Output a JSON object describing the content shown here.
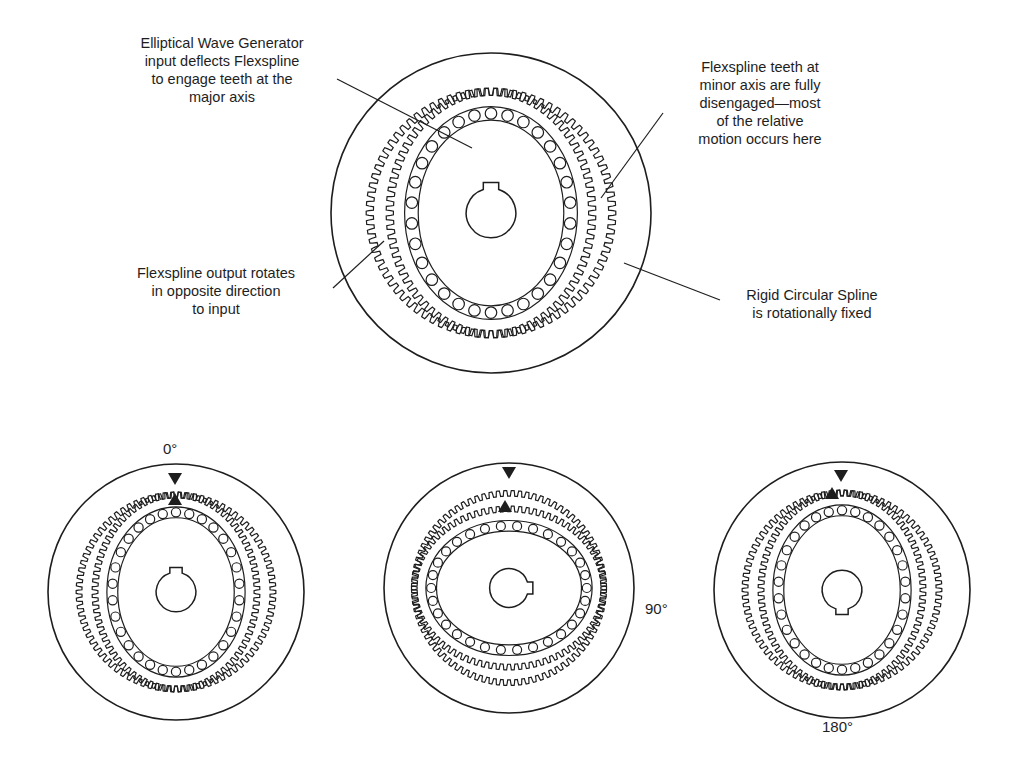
{
  "figure": {
    "main_diagram": {
      "components": [
        "Rigid Circular Spline",
        "Flexspline",
        "Elliptical Wave Generator",
        "Ball bearing ring",
        "Keyed input hub"
      ],
      "callouts": [
        {
          "id": "wave-generator",
          "lines": [
            "Elliptical Wave Generator",
            "input deflects Flexspline",
            "to engage teeth at the",
            "major axis"
          ]
        },
        {
          "id": "minor-axis",
          "lines": [
            "Flexspline teeth at",
            "minor axis are fully",
            "disengaged—most",
            "of the relative",
            "motion occurs here"
          ]
        },
        {
          "id": "flexspline-output",
          "lines": [
            "Flexspline output rotates",
            "in opposite direction",
            "to input"
          ]
        },
        {
          "id": "circular-spline",
          "lines": [
            "Rigid Circular Spline",
            "is rotationally fixed"
          ]
        }
      ]
    },
    "sequence": [
      {
        "angle_label": "0°",
        "wave_generator_rotation_deg": 0
      },
      {
        "angle_label": "90°",
        "wave_generator_rotation_deg": 90
      },
      {
        "angle_label": "180°",
        "wave_generator_rotation_deg": 180
      }
    ],
    "colors": {
      "ink": "#1e1e1e",
      "background": "#ffffff"
    }
  }
}
